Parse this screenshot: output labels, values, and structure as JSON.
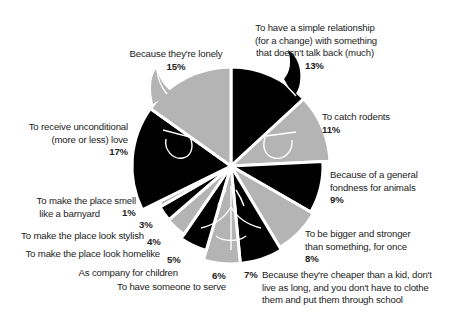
{
  "chart_data": {
    "type": "pie",
    "title": "",
    "start_angle": "12 o'clock",
    "direction": "clockwise",
    "colors": {
      "dark": "#000000",
      "light": "#b4b4b4",
      "separator": "#ffffff"
    },
    "decoration": "pie drawn as a cat face with ears and eyes",
    "slices": [
      {
        "label": "To have a simple relationship (for a change) with something that doesn't talk back (much)",
        "value": 13,
        "display": "13%",
        "color": "dark"
      },
      {
        "label": "To catch rodents",
        "value": 11,
        "display": "11%",
        "color": "light"
      },
      {
        "label": "Because of a general fondness for animals",
        "value": 9,
        "display": "9%",
        "color": "dark"
      },
      {
        "label": "To be bigger and stronger than something, for once",
        "value": 8,
        "display": "8%",
        "color": "light"
      },
      {
        "label": "Because they're cheaper than a kid, don't live as long, and you don't have to clothe them and put them through school",
        "value": 7,
        "display": "7%",
        "color": "dark"
      },
      {
        "label": "To have someone to serve",
        "value": 6,
        "display": "6%",
        "color": "light"
      },
      {
        "label": "As company for children",
        "value": 5,
        "display": "5%",
        "color": "dark"
      },
      {
        "label": "To make the place look homelike",
        "value": 4,
        "display": "4%",
        "color": "light"
      },
      {
        "label": "To make the place look stylish",
        "value": 3,
        "display": "3%",
        "color": "dark"
      },
      {
        "label": "To make the place smell like a barnyard",
        "value": 1,
        "display": "1%",
        "color": "light"
      },
      {
        "label": "To receive unconditional (more or less) love",
        "value": 17,
        "display": "17%",
        "color": "dark"
      },
      {
        "label": "Because they're lonely",
        "value": 15,
        "display": "15%",
        "color": "light"
      }
    ]
  },
  "labels": {
    "relationship": {
      "lines": [
        "To have a simple relationship",
        "(for a change) with something",
        "that doesn't talk back (much)"
      ],
      "pct": "13%"
    },
    "rodents": {
      "lines": [
        "To catch rodents"
      ],
      "pct": "11%"
    },
    "fondness": {
      "lines": [
        "Because of a general",
        "fondness for animals"
      ],
      "pct": "9%"
    },
    "bigger": {
      "lines": [
        "To be bigger and stronger",
        "than something, for once"
      ],
      "pct": "8%"
    },
    "cheaper": {
      "lines": [
        "Because they're cheaper than a kid, don't",
        "live as long, and you don't have to clothe",
        "them and put them through school"
      ],
      "pct": "7%"
    },
    "serve": {
      "lines": [
        "To have someone to serve"
      ],
      "pct": "6%"
    },
    "children": {
      "lines": [
        "As company for children"
      ],
      "pct": "5%"
    },
    "homelike": {
      "lines": [
        "To make the place look homelike"
      ],
      "pct": "4%"
    },
    "stylish": {
      "lines": [
        "To make the place look stylish"
      ],
      "pct": "3%"
    },
    "barnyard": {
      "lines": [
        "To make the place smell",
        "like a barnyard"
      ],
      "pct": "1%"
    },
    "love": {
      "lines": [
        "To receive unconditional",
        "(more or less) love"
      ],
      "pct": "17%"
    },
    "lonely": {
      "lines": [
        "Because they're lonely"
      ],
      "pct": "15%"
    }
  }
}
